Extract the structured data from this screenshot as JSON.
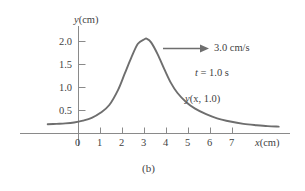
{
  "figure": {
    "caption": "(b)",
    "background_color": "#ffffff",
    "curve_color": "#6e6e6e",
    "axis_color": "#8a8a8a",
    "text_color": "#3f3f3f"
  },
  "chart_data": {
    "type": "line",
    "title": "",
    "subtitle": "",
    "xlabel": "x(cm)",
    "ylabel": "y(cm)",
    "xlim": [
      -1.4,
      9.6
    ],
    "ylim": [
      0,
      2.35
    ],
    "grid": false,
    "legend": "none",
    "xticks": [
      0,
      1,
      2,
      3,
      4,
      5,
      6,
      7
    ],
    "xtick_labels": [
      "0",
      "1",
      "2",
      "3",
      "4",
      "5",
      "6",
      "7"
    ],
    "yticks": [
      0.5,
      1.0,
      1.5,
      2.0
    ],
    "ytick_labels": [
      "0.5",
      "1.0",
      "1.5",
      "2.0"
    ],
    "series": [
      {
        "name": "y(x, 1.0)",
        "description": "Asymmetric travelling pulse peaking near x = 3.1 cm",
        "x": [
          -1.4,
          -1.0,
          -0.6,
          -0.2,
          0.2,
          0.6,
          1.0,
          1.4,
          1.8,
          2.1,
          2.4,
          2.7,
          3.0,
          3.1,
          3.3,
          3.6,
          3.9,
          4.2,
          4.5,
          4.9,
          5.3,
          5.8,
          6.3,
          6.9,
          7.5,
          8.1,
          8.6,
          9.1
        ],
        "y": [
          0.2,
          0.21,
          0.22,
          0.24,
          0.28,
          0.34,
          0.45,
          0.62,
          0.95,
          1.3,
          1.65,
          1.95,
          2.05,
          2.06,
          1.98,
          1.72,
          1.4,
          1.1,
          0.88,
          0.68,
          0.54,
          0.42,
          0.33,
          0.26,
          0.21,
          0.18,
          0.16,
          0.15
        ]
      }
    ],
    "annotations": [
      {
        "id": "velocity",
        "text": "3.0 cm/s",
        "kind": "arrow-label",
        "arrow_direction": "right"
      },
      {
        "id": "time",
        "text_italic": "t",
        "text_rest": " = 1.0 s",
        "text": "t = 1.0 s",
        "kind": "text"
      },
      {
        "id": "curve-label",
        "text_italic": "y",
        "text_rest": "(x, 1.0)",
        "text": "y(x, 1.0)",
        "kind": "curve-label"
      }
    ]
  }
}
